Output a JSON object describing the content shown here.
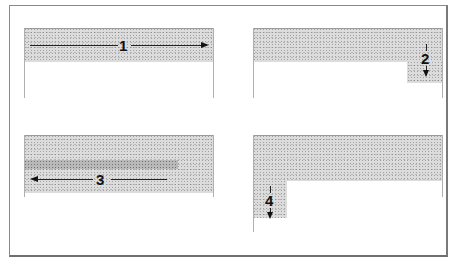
{
  "figure": {
    "colors": {
      "fill_gray": "#dcdcdc",
      "band_dark": "#b9b9b9",
      "line": "#222222",
      "frame": "#8a8a8a"
    },
    "panels": [
      {
        "label": "1",
        "direction": "right",
        "position": "top-left"
      },
      {
        "label": "2",
        "direction": "down",
        "position": "top-right"
      },
      {
        "label": "3",
        "direction": "left",
        "position": "bottom-left"
      },
      {
        "label": "4",
        "direction": "down",
        "position": "bottom-left-corner"
      }
    ]
  }
}
